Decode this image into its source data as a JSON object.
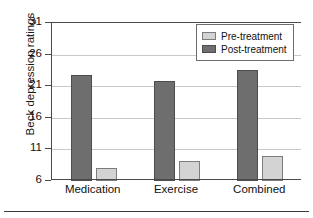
{
  "chart_data": {
    "type": "bar",
    "title": "",
    "xlabel": "",
    "ylabel": "Beck depression ratings",
    "categories": [
      "Medication",
      "Exercise",
      "Combined"
    ],
    "series": [
      {
        "name": "Pre-treatment",
        "values": [
          22.8,
          21.9,
          23.5
        ],
        "color": "#6e6e6e"
      },
      {
        "name": "Post-treatment",
        "values": [
          8.0,
          9.2,
          9.9
        ],
        "color": "#d3d3d3"
      }
    ],
    "plotted_order": [
      "Post-treatment",
      "Pre-treatment"
    ],
    "bars": [
      {
        "category": "Medication",
        "post_treatment": 22.8,
        "pre_treatment": 8.0
      },
      {
        "category": "Exercise",
        "post_treatment": 21.9,
        "pre_treatment": 9.2
      },
      {
        "category": "Combined",
        "post_treatment": 23.5,
        "pre_treatment": 9.9
      }
    ],
    "ylim": [
      6,
      31
    ],
    "yticks": [
      6,
      11,
      16,
      21,
      26,
      31
    ],
    "ytick_labels": [
      "6",
      "11",
      "16",
      "21",
      "26",
      "31"
    ],
    "grid": "horizontal",
    "legend_position": "top-right"
  },
  "legend": {
    "items": [
      {
        "label": "Pre-treatment",
        "color": "#d3d3d3"
      },
      {
        "label": "Post-treatment",
        "color": "#6e6e6e"
      }
    ]
  }
}
